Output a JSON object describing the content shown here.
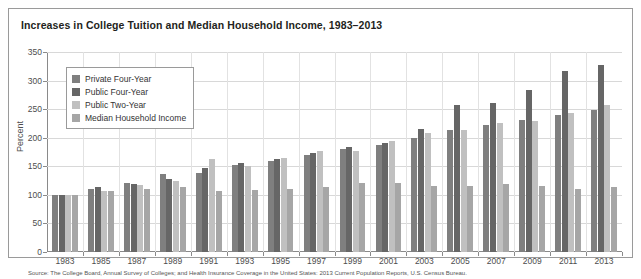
{
  "figure": {
    "title": "Increases in College Tuition and Median Household Income, 1983–2013",
    "source_note": "Source: The College Board, Annual Survey of Colleges; and Health Insurance Coverage in the United States: 2013 Current Population Reports, U.S. Census Bureau."
  },
  "legend": {
    "items": [
      {
        "label": "Private Four-Year",
        "color": "#7f7f7f"
      },
      {
        "label": "Public Four-Year",
        "color": "#666666"
      },
      {
        "label": "Public Two-Year",
        "color": "#c0c0c0"
      },
      {
        "label": "Median Household Income",
        "color": "#a6a6a6"
      }
    ]
  },
  "chart_data": {
    "type": "bar",
    "title": "Increases in College Tuition and Median Household Income, 1983–2013",
    "xlabel": "",
    "ylabel": "Percent",
    "ylim": [
      0,
      350
    ],
    "yticks": [
      0,
      50,
      100,
      150,
      200,
      250,
      300,
      350
    ],
    "grid": true,
    "legend_position": "upper-left",
    "categories": [
      "1983",
      "1985",
      "1987",
      "1989",
      "1991",
      "1993",
      "1995",
      "1997",
      "1999",
      "2001",
      "2003",
      "2005",
      "2007",
      "2009",
      "2011",
      "2013"
    ],
    "series": [
      {
        "name": "Private Four-Year",
        "color": "#7f7f7f",
        "values": [
          100,
          111,
          120,
          136,
          139,
          152,
          160,
          170,
          180,
          187,
          200,
          213,
          222,
          231,
          240,
          248
        ]
      },
      {
        "name": "Public Four-Year",
        "color": "#666666",
        "values": [
          100,
          113,
          119,
          128,
          147,
          155,
          163,
          174,
          183,
          190,
          215,
          258,
          261,
          283,
          317,
          328
        ]
      },
      {
        "name": "Public Two-Year",
        "color": "#c0c0c0",
        "values": [
          100,
          107,
          118,
          124,
          163,
          150,
          165,
          177,
          176,
          195,
          208,
          214,
          225,
          230,
          243,
          258
        ]
      },
      {
        "name": "Median Household Income",
        "color": "#a6a6a6",
        "values": [
          100,
          106,
          110,
          113,
          107,
          108,
          111,
          113,
          121,
          120,
          116,
          116,
          119,
          115,
          111,
          113
        ]
      }
    ]
  }
}
